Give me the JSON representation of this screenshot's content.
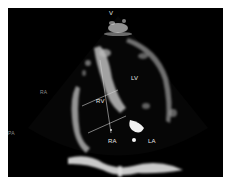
{
  "image": {
    "description": "Echocardiogram apical four-chamber view with RV measurement lines",
    "background_color": "#000000",
    "border_color": "#ffffff"
  },
  "labels": {
    "top_marker": "V",
    "rv": "RV",
    "lv": "LV",
    "ra": "RA",
    "la": "LA",
    "left_upper": "RA",
    "left_lower": "PA"
  }
}
